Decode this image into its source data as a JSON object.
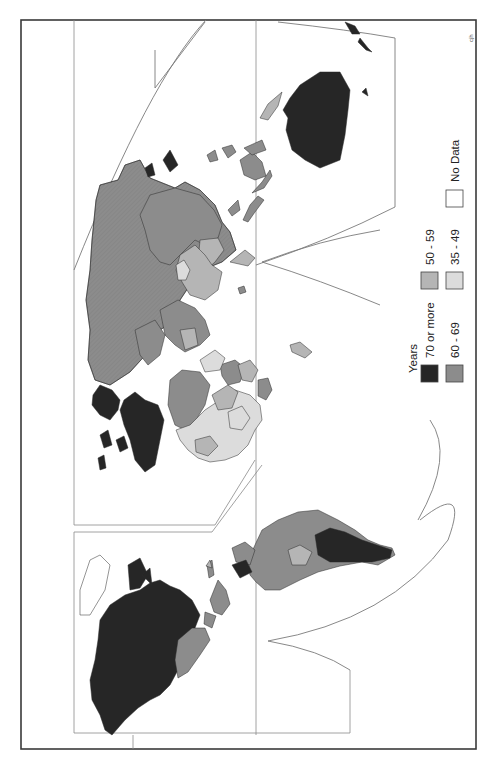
{
  "map": {
    "title": "Life expectancy at birth (world map, rotated 90°)",
    "credit": "cjh",
    "orientation": "rotated -90 degrees (north points left)",
    "legend": {
      "title": "Years",
      "items": [
        {
          "label": "70 or more",
          "color": "#262626"
        },
        {
          "label": "60 - 69",
          "color": "#8c8c8c"
        },
        {
          "label": "50 - 59",
          "color": "#b5b5b5"
        },
        {
          "label": "35 - 49",
          "color": "#dcdcdc"
        },
        {
          "label": "No Data",
          "color": "#ffffff"
        }
      ]
    },
    "regions": [
      {
        "name": "North America (USA/Canada)",
        "class": "70 or more"
      },
      {
        "name": "Central America / Caribbean",
        "class": "60 - 69"
      },
      {
        "name": "South America (most)",
        "class": "60 - 69"
      },
      {
        "name": "Southern South America",
        "class": "70 or more"
      },
      {
        "name": "Bolivia",
        "class": "50 - 59"
      },
      {
        "name": "Western Europe",
        "class": "70 or more"
      },
      {
        "name": "USSR / North Asia",
        "class": "60 - 69"
      },
      {
        "name": "North Africa / Middle East",
        "class": "60 - 69"
      },
      {
        "name": "Sub-Saharan Africa",
        "class": "35 - 49"
      },
      {
        "name": "South Asia",
        "class": "50 - 59"
      },
      {
        "name": "China",
        "class": "60 - 69"
      },
      {
        "name": "Japan",
        "class": "70 or more"
      },
      {
        "name": "Southeast Asia",
        "class": "50 - 59"
      },
      {
        "name": "Australia",
        "class": "70 or more"
      },
      {
        "name": "New Zealand",
        "class": "70 or more"
      }
    ]
  }
}
